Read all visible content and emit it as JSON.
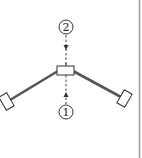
{
  "diagram": {
    "labels": {
      "top": "2",
      "bottom": "1"
    },
    "colors": {
      "arm": "#555555",
      "outline": "#333333",
      "border": "#9a9a9a",
      "background": "#ffffff"
    }
  }
}
